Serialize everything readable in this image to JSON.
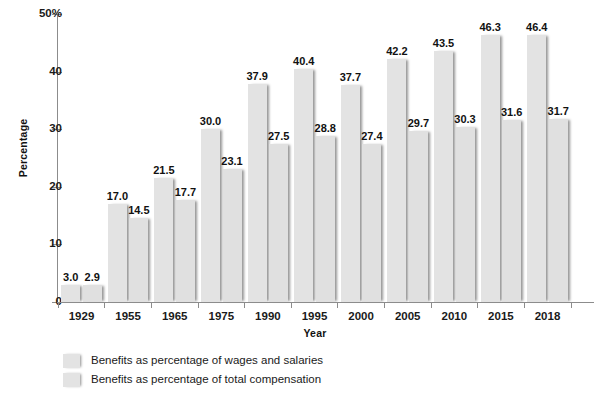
{
  "chart_data": {
    "type": "bar",
    "title": "",
    "xlabel": "Year",
    "ylabel": "Percentage",
    "ylim": [
      0,
      50
    ],
    "yticks": [
      0,
      10,
      20,
      30,
      40,
      50
    ],
    "ytick_labels": [
      "0",
      "10",
      "20",
      "30",
      "40",
      "50%"
    ],
    "grid": false,
    "legend_position": "bottom-left",
    "categories": [
      "1929",
      "1955",
      "1965",
      "1975",
      "1990",
      "1995",
      "2000",
      "2005",
      "2010",
      "2015",
      "2018"
    ],
    "series": [
      {
        "name": "Benefits as percentage of wages and salaries",
        "color": "#e3e3e3",
        "values": [
          3.0,
          17.0,
          21.5,
          30.0,
          37.9,
          40.4,
          37.7,
          42.2,
          43.5,
          46.3,
          46.4
        ],
        "value_labels": [
          "3.0",
          "17.0",
          "21.5",
          "30.0",
          "37.9",
          "40.4",
          "37.7",
          "42.2",
          "43.5",
          "46.3",
          "46.4"
        ]
      },
      {
        "name": "Benefits as percentage of total compensation",
        "color": "#e0e0e0",
        "values": [
          2.9,
          14.5,
          17.7,
          23.1,
          27.5,
          28.8,
          27.4,
          29.7,
          30.3,
          31.6,
          31.7
        ],
        "value_labels": [
          "2.9",
          "14.5",
          "17.7",
          "23.1",
          "27.5",
          "28.8",
          "27.4",
          "29.7",
          "30.3",
          "31.6",
          "31.7"
        ]
      }
    ]
  },
  "axes": {
    "y_title": "Percentage",
    "x_title": "Year"
  },
  "legend": {
    "items": [
      {
        "label": "Benefits as percentage of wages and salaries"
      },
      {
        "label": "Benefits as percentage of total compensation"
      }
    ]
  },
  "colors": {
    "bar_series_a": "#e3e3e3",
    "bar_series_b": "#e0e0e0",
    "axis": "#8c8c8c",
    "text": "#1a1a1a",
    "background": "#ffffff"
  }
}
